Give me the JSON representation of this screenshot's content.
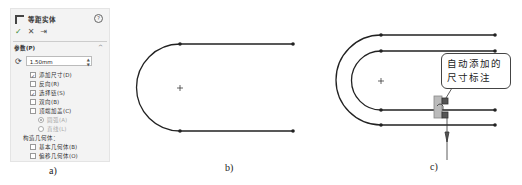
{
  "panel_a": {
    "title": "等距实体",
    "help_icon": "?",
    "actions": {
      "ok": "✓",
      "cancel": "✕",
      "pin": "⇥"
    },
    "section": "参数(P)",
    "offset_value": "1.50mm",
    "options": [
      {
        "label": "添加尺寸(D)",
        "checked": true
      },
      {
        "label": "反向(R)",
        "checked": false
      },
      {
        "label": "选择链(S)",
        "checked": true
      },
      {
        "label": "双向(B)",
        "checked": false
      },
      {
        "label": "顶端加盖(C)",
        "checked": false
      }
    ],
    "cap_options": [
      {
        "label": "圆弧(A)",
        "selected": true
      },
      {
        "label": "直线(L)",
        "selected": false
      }
    ],
    "construction_label": "构造几何体：",
    "construction_options": [
      {
        "label": "基本几何体(B)",
        "checked": false
      },
      {
        "label": "偏移几何体(O)",
        "checked": false
      }
    ]
  },
  "callout": {
    "line1": "自动添加的",
    "line2": "尺寸标注"
  },
  "captions": {
    "a": "a)",
    "b": "b)",
    "c": "c)"
  }
}
